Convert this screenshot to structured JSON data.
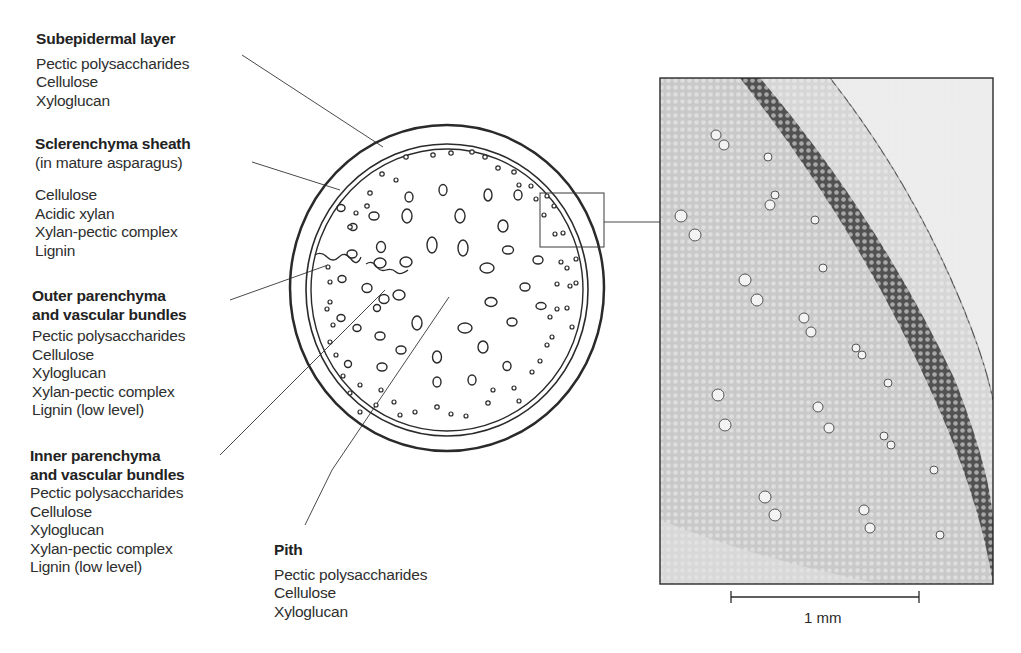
{
  "labels": {
    "subepidermal": {
      "title": "Subepidermal layer",
      "items": [
        "Pectic polysaccharides",
        "Cellulose",
        "Xyloglucan"
      ]
    },
    "sclerenchyma": {
      "title": "Sclerenchyma sheath",
      "subtitle": "(in mature asparagus)",
      "items": [
        "Cellulose",
        "Acidic xylan",
        "Xylan-pectic complex",
        "Lignin"
      ]
    },
    "outer_parenchyma": {
      "title_line1": "Outer parenchyma",
      "title_line2": "and vascular bundles",
      "items": [
        "Pectic polysaccharides",
        "Cellulose",
        "Xyloglucan",
        "Xylan-pectic complex",
        "Lignin (low level)"
      ]
    },
    "inner_parenchyma": {
      "title_line1": "Inner parenchyma",
      "title_line2": "and vascular bundles",
      "items": [
        "Pectic polysaccharides",
        "Cellulose",
        "Xyloglucan",
        "Xylan-pectic complex",
        "Lignin (low level)"
      ]
    },
    "pith": {
      "title": "Pith",
      "items": [
        "Pectic polysaccharides",
        "Cellulose",
        "Xyloglucan"
      ]
    }
  },
  "micrograph": {
    "scale_bar_label": "1 mm"
  },
  "colors": {
    "line": "#3a3a3a",
    "tissue_light": "#d8d8d8",
    "tissue_dark": "#4a4a4a",
    "epidermis": "#e6e6e6"
  }
}
